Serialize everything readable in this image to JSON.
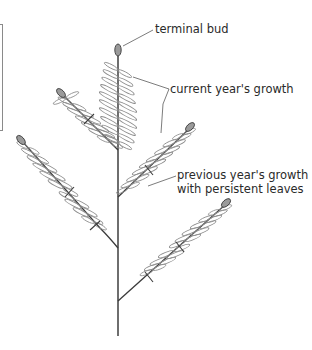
{
  "diagram": {
    "type": "botanical illustration",
    "labels": {
      "terminal_bud": "terminal bud",
      "current_growth": "current year's growth",
      "previous_growth_line1": "previous year's growth",
      "previous_growth_line2": "with persistent leaves"
    },
    "colors": {
      "stem": "#3a3a3a",
      "leaflet": "#8c8c8c",
      "bud": "#9a9a9a",
      "text": "#2a2a2a"
    }
  }
}
